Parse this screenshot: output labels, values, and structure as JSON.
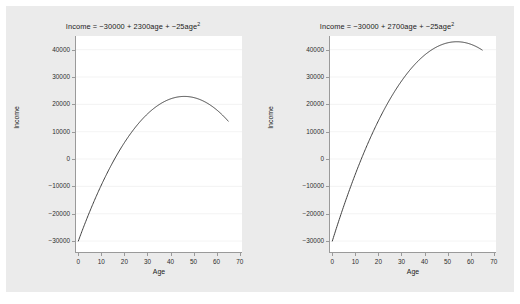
{
  "figure": {
    "background": "#ebebeb",
    "outer_background": "#ffffff",
    "plot_background": "#ffffff"
  },
  "chart_data": [
    {
      "type": "line",
      "title_parts": {
        "prefix": "Income = −30000 + 2300age + −25age",
        "exponent": "2"
      },
      "title": "Income = −30000 + 2300age + −25age²",
      "xlabel": "Age",
      "ylabel": "Income",
      "xlim": [
        -1,
        71
      ],
      "ylim": [
        -34000,
        45000
      ],
      "xticks": [
        0,
        10,
        20,
        30,
        40,
        50,
        60,
        70
      ],
      "xtick_labels": [
        "0",
        "10",
        "20",
        "30",
        "40",
        "50",
        "60",
        "70"
      ],
      "yticks": [
        -30000,
        -20000,
        -10000,
        0,
        10000,
        20000,
        30000,
        40000
      ],
      "ytick_labels": [
        "−30000",
        "−20000",
        "−10000",
        "0",
        "10000",
        "20000",
        "30000",
        "40000"
      ],
      "grid": true,
      "grid_color": "#f0f0f0",
      "line_color": "#404040",
      "equation": {
        "intercept": -30000,
        "linear": 2300,
        "quadratic": -25
      },
      "x_domain": [
        0,
        65
      ],
      "x": [
        0,
        5,
        10,
        15,
        20,
        25,
        30,
        35,
        40,
        45,
        46,
        50,
        55,
        60,
        65
      ],
      "values": [
        -30000,
        -19125,
        -9500,
        -875,
        6000,
        11875,
        16500,
        19875,
        22000,
        22875,
        22900,
        22500,
        20875,
        18000,
        13875
      ]
    },
    {
      "type": "line",
      "title_parts": {
        "prefix": "Income = −30000 + 2700age + −25age",
        "exponent": "2"
      },
      "title": "Income = −30000 + 2700age + −25age²",
      "xlabel": "Age",
      "ylabel": "Income",
      "xlim": [
        -1,
        71
      ],
      "ylim": [
        -34000,
        45000
      ],
      "xticks": [
        0,
        10,
        20,
        30,
        40,
        50,
        60,
        70
      ],
      "xtick_labels": [
        "0",
        "10",
        "20",
        "30",
        "40",
        "50",
        "60",
        "70"
      ],
      "yticks": [
        -30000,
        -20000,
        -10000,
        0,
        10000,
        20000,
        30000,
        40000
      ],
      "ytick_labels": [
        "−30000",
        "−20000",
        "−10000",
        "0",
        "10000",
        "20000",
        "30000",
        "40000"
      ],
      "grid": true,
      "grid_color": "#f0f0f0",
      "line_color": "#404040",
      "equation": {
        "intercept": -30000,
        "linear": 2700,
        "quadratic": -25
      },
      "x_domain": [
        0,
        65
      ],
      "x": [
        0,
        5,
        10,
        15,
        20,
        25,
        30,
        35,
        40,
        45,
        50,
        54,
        55,
        60,
        65
      ],
      "values": [
        -30000,
        -17125,
        -5500,
        4875,
        14000,
        21875,
        28500,
        33875,
        38000,
        40875,
        42500,
        42900,
        42875,
        42000,
        39875
      ]
    }
  ]
}
